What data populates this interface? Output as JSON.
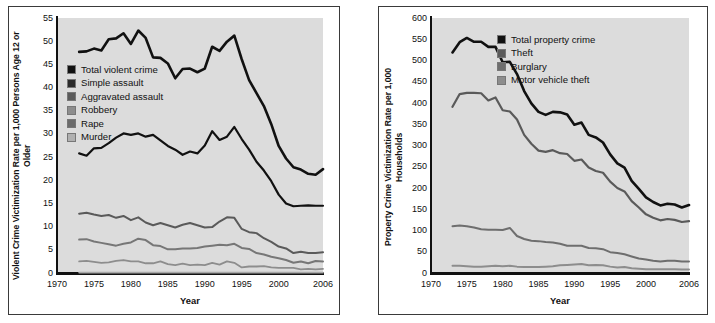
{
  "figure": {
    "background": "#ffffff",
    "panel_border_color": "#3a3a3a",
    "plot_background": "#dcdcdc"
  },
  "charts": [
    {
      "id": "violent-crime",
      "type": "line",
      "title": "",
      "xlabel": "Year",
      "ylabel": "Violent Crime Victimization Rate per 1,000 Persons Age 12 or Older",
      "ylabel_line1": "Violent Crime Victimization Rate per 1,000",
      "ylabel_line2": "Persons Age 12 or Older",
      "xlim": [
        1970,
        2006
      ],
      "ylim": [
        0,
        55
      ],
      "xticks": [
        1970,
        1975,
        1980,
        1985,
        1990,
        1995,
        2000,
        2006
      ],
      "xtick_labels": [
        "1970",
        "1975",
        "1980",
        "1985",
        "1990",
        "1995",
        "2000",
        "2006"
      ],
      "yticks": [
        0,
        5,
        10,
        15,
        20,
        25,
        30,
        35,
        40,
        45,
        50,
        55
      ],
      "ytick_labels": [
        "0",
        "5",
        "10",
        "15",
        "20",
        "25",
        "30",
        "35",
        "40",
        "45",
        "50",
        "55"
      ],
      "grid": false,
      "legend_position": "upper-left-inside",
      "x": [
        1973,
        1974,
        1975,
        1976,
        1977,
        1978,
        1979,
        1980,
        1981,
        1982,
        1983,
        1984,
        1985,
        1986,
        1987,
        1988,
        1989,
        1990,
        1991,
        1992,
        1993,
        1994,
        1995,
        1996,
        1997,
        1998,
        1999,
        2000,
        2001,
        2002,
        2003,
        2004,
        2005,
        2006
      ],
      "series": [
        {
          "name": "Total violent crime",
          "color": "#111111",
          "width": 2.6,
          "values": [
            47.7,
            47.8,
            48.4,
            48.0,
            50.4,
            50.6,
            51.7,
            49.4,
            52.3,
            50.7,
            46.5,
            46.4,
            45.2,
            42.0,
            44.0,
            44.1,
            43.3,
            44.1,
            48.8,
            47.9,
            49.9,
            51.2,
            46.1,
            41.6,
            38.8,
            36.0,
            32.1,
            27.4,
            24.7,
            22.8,
            22.3,
            21.4,
            21.2,
            22.4
          ]
        },
        {
          "name": "Simple assault",
          "color": "#111111",
          "width": 2.2,
          "values": [
            25.8,
            25.3,
            26.9,
            27.0,
            28.0,
            29.2,
            30.1,
            29.8,
            30.1,
            29.4,
            29.8,
            28.6,
            27.4,
            26.6,
            25.5,
            26.2,
            25.8,
            27.5,
            30.6,
            28.7,
            29.4,
            31.5,
            28.9,
            26.6,
            24.0,
            22.1,
            19.8,
            16.9,
            15.0,
            14.4,
            14.5,
            14.6,
            14.5,
            14.5
          ]
        },
        {
          "name": "Aggravated assault",
          "color": "#5a5a5a",
          "width": 2.0,
          "values": [
            12.8,
            13.0,
            12.6,
            12.3,
            12.5,
            11.9,
            12.3,
            11.4,
            12.0,
            10.9,
            10.3,
            10.8,
            10.3,
            9.8,
            10.4,
            10.8,
            10.3,
            9.8,
            9.9,
            11.1,
            12.0,
            11.9,
            9.5,
            8.8,
            8.6,
            7.5,
            6.7,
            5.7,
            5.3,
            4.3,
            4.6,
            4.3,
            4.3,
            4.5
          ]
        },
        {
          "name": "Robbery",
          "color": "#777777",
          "width": 2.0,
          "values": [
            7.2,
            7.3,
            6.8,
            6.5,
            6.2,
            5.9,
            6.3,
            6.6,
            7.4,
            7.1,
            6.0,
            5.8,
            5.1,
            5.1,
            5.3,
            5.3,
            5.4,
            5.7,
            5.9,
            6.1,
            6.0,
            6.3,
            5.4,
            5.2,
            4.3,
            4.0,
            3.5,
            3.2,
            2.8,
            2.2,
            2.5,
            2.1,
            2.6,
            2.5
          ]
        },
        {
          "name": "Rape",
          "color": "#8d8d8d",
          "width": 1.8,
          "values": [
            2.5,
            2.6,
            2.4,
            2.2,
            2.3,
            2.6,
            2.8,
            2.5,
            2.5,
            2.1,
            2.1,
            2.5,
            1.9,
            1.7,
            2.0,
            1.7,
            1.8,
            1.7,
            2.2,
            1.8,
            2.5,
            2.2,
            1.2,
            1.4,
            1.4,
            1.5,
            1.2,
            1.1,
            1.1,
            1.1,
            0.8,
            0.9,
            0.8,
            0.9
          ]
        },
        {
          "name": "Murder",
          "color": "#a8a8a8",
          "width": 1.8,
          "values": [
            0.1,
            0.1,
            0.1,
            0.1,
            0.1,
            0.1,
            0.1,
            0.1,
            0.1,
            0.1,
            0.1,
            0.1,
            0.1,
            0.1,
            0.1,
            0.1,
            0.1,
            0.1,
            0.1,
            0.1,
            0.1,
            0.1,
            0.1,
            0.1,
            0.1,
            0.1,
            0.1,
            0.1,
            0.1,
            0.1,
            0.1,
            0.1,
            0.1,
            0.1
          ]
        }
      ],
      "legend": [
        {
          "label": "Total violent crime",
          "color": "#111111"
        },
        {
          "label": "Simple assault",
          "color": "#2a2a2a"
        },
        {
          "label": "Aggravated assault",
          "color": "#5a5a5a"
        },
        {
          "label": "Robbery",
          "color": "#8d8d8d"
        },
        {
          "label": "Rape",
          "color": "#6b6b6b"
        },
        {
          "label": "Murder",
          "color": "#b0b0b0"
        }
      ]
    },
    {
      "id": "property-crime",
      "type": "line",
      "title": "",
      "xlabel": "Year",
      "ylabel": "Property Crime Victimization Rate per 1,000 Households",
      "ylabel_line1": "Property Crime Victimization Rate",
      "ylabel_line2": "per 1,000 Households",
      "xlim": [
        1970,
        2006
      ],
      "ylim": [
        0,
        600
      ],
      "xticks": [
        1970,
        1975,
        1980,
        1985,
        1990,
        1995,
        2000,
        2006
      ],
      "xtick_labels": [
        "1970",
        "1975",
        "1980",
        "1985",
        "1990",
        "1995",
        "2000",
        "2006"
      ],
      "yticks": [
        0,
        50,
        100,
        150,
        200,
        250,
        300,
        350,
        400,
        450,
        500,
        550,
        600
      ],
      "ytick_labels": [
        "0",
        "50",
        "100",
        "150",
        "200",
        "250",
        "300",
        "350",
        "400",
        "450",
        "500",
        "550",
        "600"
      ],
      "grid": false,
      "legend_position": "upper-right-inside",
      "x": [
        1973,
        1974,
        1975,
        1976,
        1977,
        1978,
        1979,
        1980,
        1981,
        1982,
        1983,
        1984,
        1985,
        1986,
        1987,
        1988,
        1989,
        1990,
        1991,
        1992,
        1993,
        1994,
        1995,
        1996,
        1997,
        1998,
        1999,
        2000,
        2001,
        2002,
        2003,
        2004,
        2005,
        2006
      ],
      "series": [
        {
          "name": "Total property crime",
          "color": "#111111",
          "width": 2.6,
          "values": [
            519,
            543,
            553,
            544,
            544,
            532,
            532,
            496,
            497,
            468,
            428,
            399,
            379,
            372,
            379,
            378,
            373,
            349,
            354,
            325,
            319,
            307,
            279,
            258,
            248,
            217,
            198,
            178,
            167,
            159,
            163,
            161,
            154,
            160
          ]
        },
        {
          "name": "Theft",
          "color": "#5a5a5a",
          "width": 2.2,
          "values": [
            391,
            421,
            424,
            424,
            423,
            406,
            413,
            383,
            380,
            361,
            325,
            304,
            288,
            285,
            289,
            282,
            280,
            264,
            267,
            248,
            240,
            236,
            215,
            200,
            192,
            169,
            154,
            138,
            130,
            124,
            127,
            125,
            120,
            122
          ]
        },
        {
          "name": "Burglary",
          "color": "#6e6e6e",
          "width": 2.0,
          "values": [
            110,
            112,
            110,
            107,
            103,
            102,
            102,
            101,
            106,
            87,
            80,
            76,
            75,
            73,
            72,
            69,
            64,
            64,
            64,
            59,
            58,
            56,
            49,
            47,
            44,
            39,
            34,
            32,
            29,
            27,
            29,
            29,
            27,
            27
          ]
        },
        {
          "name": "Motor vehicle theft",
          "color": "#8d8d8d",
          "width": 2.0,
          "values": [
            17,
            17,
            16,
            15,
            15,
            16,
            17,
            16,
            17,
            15,
            14,
            14,
            14,
            15,
            16,
            18,
            19,
            20,
            21,
            18,
            19,
            18,
            15,
            13,
            14,
            11,
            10,
            9,
            9,
            9,
            9,
            9,
            8,
            8
          ]
        }
      ],
      "legend": [
        {
          "label": "Total property crime",
          "color": "#111111"
        },
        {
          "label": "Theft",
          "color": "#5a5a5a"
        },
        {
          "label": "Burglary",
          "color": "#6e6e6e"
        },
        {
          "label": "Motor vehicle theft",
          "color": "#8d8d8d"
        }
      ]
    }
  ]
}
